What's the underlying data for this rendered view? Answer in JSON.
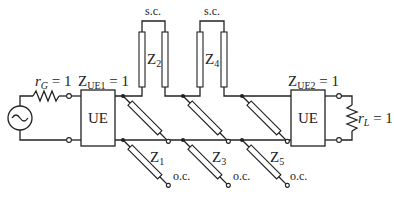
{
  "diagram": {
    "source": {
      "label_var": "r",
      "label_sub": "G",
      "label_val": " = 1"
    },
    "load": {
      "label_var": "r",
      "label_sub": "L",
      "label_val": " = 1"
    },
    "ue1": {
      "box_text": "UE",
      "label_var": "Z",
      "label_sub": "UE1",
      "label_val": " = 1"
    },
    "ue2": {
      "box_text": "UE",
      "label_var": "Z",
      "label_sub": "UE2",
      "label_val": " = 1"
    },
    "stubs": [
      {
        "name": "Z",
        "sub": "1",
        "termination": "o.c."
      },
      {
        "name": "Z",
        "sub": "2",
        "termination": "s.c."
      },
      {
        "name": "Z",
        "sub": "3",
        "termination": "o.c."
      },
      {
        "name": "Z",
        "sub": "4",
        "termination": "s.c."
      },
      {
        "name": "Z",
        "sub": "5",
        "termination": "o.c."
      }
    ]
  }
}
